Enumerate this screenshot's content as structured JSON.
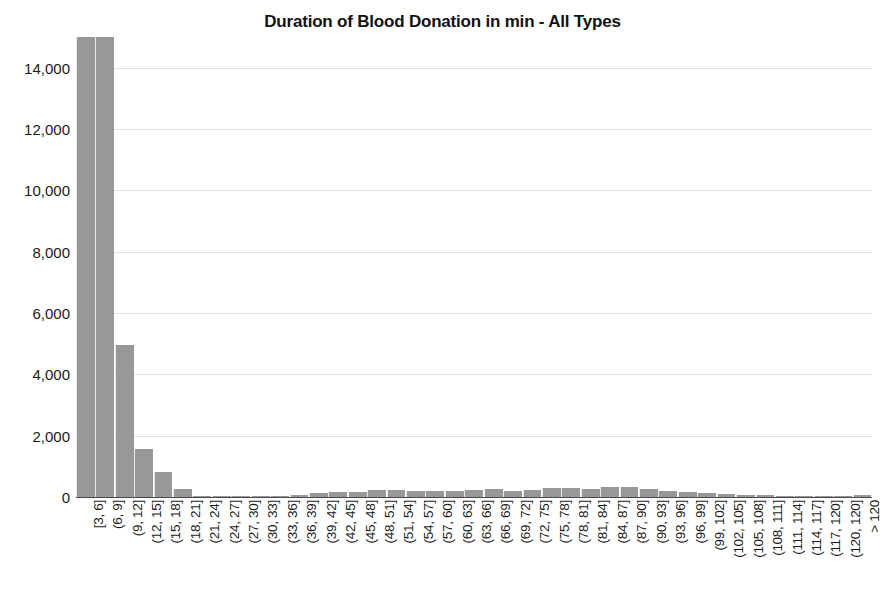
{
  "chart_data": {
    "type": "bar",
    "title": "Duration of Blood Donation in min - All Types",
    "xlabel": "",
    "ylabel": "",
    "ylim": [
      0,
      15000
    ],
    "grid": true,
    "legend": null,
    "y_ticks": [
      0,
      2000,
      4000,
      6000,
      8000,
      10000,
      12000,
      14000
    ],
    "y_tick_labels": [
      "0",
      "2,000",
      "4,000",
      "6,000",
      "8,000",
      "10,000",
      "12,000",
      "14,000"
    ],
    "note": "First two bars are clipped at the top of the plot area (axis maximum reached).",
    "bar_color": "#989898",
    "categories": [
      "[3, 6]",
      "(6, 9]",
      "(9, 12]",
      "(12, 15]",
      "(15, 18]",
      "(18, 21]",
      "(21, 24]",
      "(24, 27]",
      "(27, 30]",
      "(30, 33]",
      "(33, 36]",
      "(36, 39]",
      "(39, 42]",
      "(42, 45]",
      "(45, 48]",
      "(48, 51]",
      "(51, 54]",
      "(54, 57]",
      "(57, 60]",
      "(60, 63]",
      "(63, 66]",
      "(66, 69]",
      "(69, 72]",
      "(72, 75]",
      "(75, 78]",
      "(78, 81]",
      "(81, 84]",
      "(84, 87]",
      "(87, 90]",
      "(90, 93]",
      "(93, 96]",
      "(96, 99]",
      "(99, 102]",
      "(102, 105]",
      "(105, 108]",
      "(108, 111]",
      "(111, 114]",
      "(114, 117]",
      "(117, 120]",
      "(120, 120]",
      "> 120"
    ],
    "values": [
      15000,
      15000,
      4950,
      1560,
      810,
      260,
      10,
      5,
      5,
      5,
      10,
      70,
      130,
      175,
      170,
      220,
      235,
      185,
      190,
      210,
      215,
      250,
      205,
      240,
      290,
      300,
      270,
      320,
      330,
      250,
      210,
      150,
      120,
      105,
      80,
      60,
      45,
      35,
      25,
      15,
      60
    ]
  }
}
